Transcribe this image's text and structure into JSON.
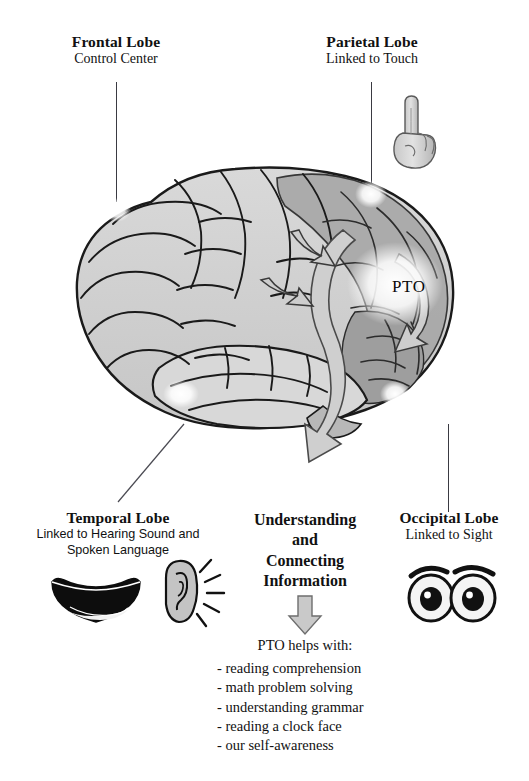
{
  "document": {
    "type": "brain-lobes-diagram",
    "background_color": "#ffffff"
  },
  "callouts": {
    "frontal": {
      "title": "Frontal Lobe",
      "subtitle": "Control Center"
    },
    "parietal": {
      "title": "Parietal Lobe",
      "subtitle": "Linked to Touch"
    },
    "temporal": {
      "title": "Temporal Lobe",
      "subtitle_line1": "Linked to Hearing Sound and",
      "subtitle_line2": "Spoken Language"
    },
    "occipital": {
      "title": "Occipital Lobe",
      "subtitle": "Linked to Sight"
    }
  },
  "brain": {
    "pto_label": "PTO",
    "colors": {
      "light_gyri": "#d2d2d2",
      "mid_gyri": "#c0c0c0",
      "dark_region": "#a2a2a2",
      "outline": "#1a1a1a",
      "arrow_fill": "#cfcfcf",
      "arrow_outline": "#4a4a4a",
      "glow": "#ffffff"
    }
  },
  "center": {
    "line1": "Understanding",
    "line2": "and",
    "line3": "Connecting",
    "line4": "Information"
  },
  "pto_helps": {
    "heading": "PTO helps with:",
    "items": [
      "- reading comprehension",
      "- math problem solving",
      "- understanding grammar",
      "- reading a clock face",
      "- our self-awareness"
    ]
  },
  "icons": {
    "pointing_hand": "pointing-hand-icon",
    "mouth": "smiling-mouth-icon",
    "ear": "ear-with-sound-rays-icon",
    "eyes": "pair-of-eyes-icon",
    "down_arrow": "down-arrow-icon",
    "curved_arrow": "curved-arrow-icon"
  }
}
